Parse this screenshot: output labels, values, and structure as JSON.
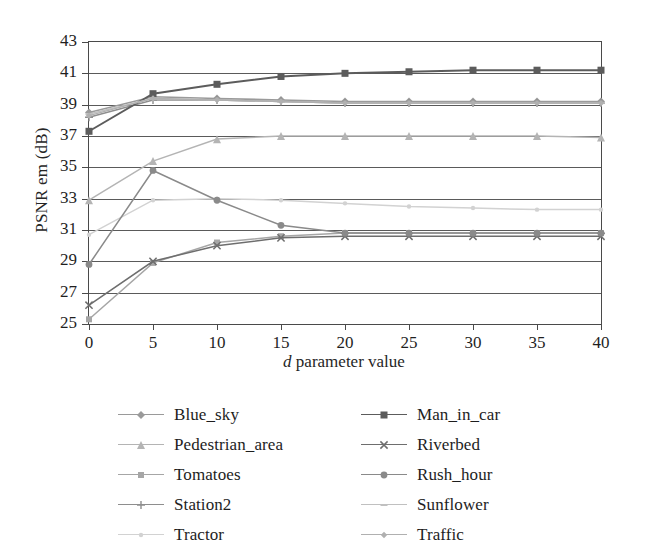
{
  "chart_data": {
    "type": "line",
    "title": "",
    "xlabel": "d parameter value",
    "xlabel_italic_prefix": "d",
    "xlabel_rest": " parameter value",
    "ylabel": "PSNR em (dB)",
    "x": [
      0,
      5,
      10,
      15,
      20,
      25,
      30,
      35,
      40
    ],
    "xlim": [
      0,
      40
    ],
    "ylim": [
      25,
      43
    ],
    "xticks": [
      "0",
      "5",
      "10",
      "15",
      "20",
      "25",
      "30",
      "35",
      "40"
    ],
    "yticks": [
      "25",
      "27",
      "29",
      "31",
      "33",
      "35",
      "37",
      "39",
      "41",
      "43"
    ],
    "grid": true,
    "grid_axis": "y",
    "legend_position": "bottom",
    "legend_columns": 2,
    "series": [
      {
        "name": "Blue_sky",
        "marker": "diamond",
        "color": "#9a9a9a",
        "legend_column": 1,
        "values": [
          38.5,
          39.5,
          39.4,
          39.3,
          39.2,
          39.2,
          39.2,
          39.2,
          39.2
        ]
      },
      {
        "name": "Pedestrian_area",
        "marker": "triangle",
        "color": "#b4b4b4",
        "legend_column": 1,
        "values": [
          32.9,
          35.4,
          36.8,
          37.0,
          37.0,
          37.0,
          37.0,
          37.0,
          36.9
        ]
      },
      {
        "name": "Tomatoes",
        "marker": "square",
        "color": "#a6a6a6",
        "legend_column": 1,
        "values": [
          25.3,
          28.9,
          30.2,
          30.6,
          30.8,
          30.8,
          30.8,
          30.8,
          30.8
        ]
      },
      {
        "name": "Station2",
        "marker": "plus",
        "color": "#8e8e8e",
        "legend_column": 1,
        "values": [
          38.2,
          39.3,
          39.3,
          39.2,
          39.1,
          39.1,
          39.1,
          39.1,
          39.1
        ]
      },
      {
        "name": "Tractor",
        "marker": "dot",
        "color": "#d2d2d2",
        "legend_column": 1,
        "values": [
          30.7,
          32.9,
          33.0,
          32.9,
          32.7,
          32.5,
          32.4,
          32.3,
          32.3
        ]
      },
      {
        "name": "Man_in_car",
        "marker": "filled-square",
        "color": "#5c5c5c",
        "legend_column": 2,
        "values": [
          37.3,
          39.7,
          40.3,
          40.8,
          41.0,
          41.1,
          41.2,
          41.2,
          41.2
        ]
      },
      {
        "name": "Riverbed",
        "marker": "cross",
        "color": "#6e6e6e",
        "legend_column": 2,
        "values": [
          26.2,
          29.0,
          30.0,
          30.5,
          30.6,
          30.6,
          30.6,
          30.6,
          30.6
        ]
      },
      {
        "name": "Rush_hour",
        "marker": "circle",
        "color": "#8a8a8a",
        "legend_column": 2,
        "values": [
          28.8,
          34.8,
          32.9,
          31.3,
          30.8,
          30.8,
          30.8,
          30.8,
          30.8
        ]
      },
      {
        "name": "Sunflower",
        "marker": "dash",
        "color": "#c0c0c0",
        "legend_column": 2,
        "values": [
          38.4,
          39.4,
          39.3,
          39.2,
          39.1,
          39.1,
          39.1,
          39.1,
          39.1
        ]
      },
      {
        "name": "Traffic",
        "marker": "small-diamond",
        "color": "#b0b0b0",
        "legend_column": 2,
        "values": [
          38.3,
          39.4,
          39.3,
          39.2,
          39.1,
          39.1,
          39.1,
          39.1,
          39.1
        ]
      }
    ]
  }
}
